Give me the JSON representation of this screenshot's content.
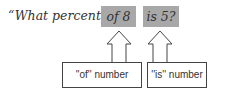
{
  "question": {
    "prefix": "“What percent",
    "of_part": "of 8",
    "is_part": "is 5?"
  },
  "labels": {
    "of_label": "''of'' number",
    "is_label": "''is'' number"
  },
  "colors": {
    "highlight": "#a8a8a8",
    "text": "#333333",
    "stroke": "#444444"
  }
}
